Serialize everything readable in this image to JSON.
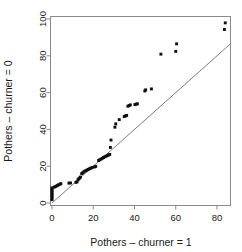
{
  "chart_data": {
    "type": "scatter",
    "title": "",
    "subtitle": "",
    "xlabel": "Pothers – churner = 1",
    "ylabel": "Pothers – churner = 0",
    "xlim": [
      -3,
      87
    ],
    "ylim": [
      -3,
      103
    ],
    "xticks": [
      0,
      20,
      40,
      60,
      80
    ],
    "yticks": [
      0,
      20,
      40,
      60,
      80,
      100
    ],
    "xticklabels": [
      "0",
      "20",
      "40",
      "60",
      "80"
    ],
    "yticklabels": [
      "0",
      "20",
      "40",
      "60",
      "80",
      "100"
    ],
    "grid": false,
    "legend": null,
    "annotations": [],
    "reference_line": {
      "name": "identity-line",
      "type": "line",
      "slope": 1,
      "intercept": 0,
      "x_from": 0,
      "x_to": 87,
      "color": "#6f6f6f"
    },
    "series": [
      {
        "name": "quantile-points",
        "marker": "filled-square",
        "color": "#101010",
        "points": [
          [
            0.0,
            1.8
          ],
          [
            0.0,
            2.6
          ],
          [
            0.0,
            3.4
          ],
          [
            0.0,
            4.2
          ],
          [
            0.0,
            5.0
          ],
          [
            0.0,
            5.8
          ],
          [
            0.0,
            6.6
          ],
          [
            0.0,
            7.4
          ],
          [
            0.0,
            8.2
          ],
          [
            1.0,
            8.6
          ],
          [
            1.6,
            8.9
          ],
          [
            2.1,
            9.2
          ],
          [
            2.7,
            9.6
          ],
          [
            3.2,
            9.9
          ],
          [
            3.8,
            10.2
          ],
          [
            4.3,
            10.5
          ],
          [
            8.2,
            10.8
          ],
          [
            9.0,
            10.9
          ],
          [
            11.6,
            11.2
          ],
          [
            12.1,
            11.5
          ],
          [
            12.6,
            12.6
          ],
          [
            13.0,
            13.2
          ],
          [
            13.4,
            13.6
          ],
          [
            13.8,
            14.1
          ],
          [
            14.4,
            16.0
          ],
          [
            14.9,
            16.4
          ],
          [
            15.4,
            16.9
          ],
          [
            15.9,
            17.3
          ],
          [
            16.5,
            17.6
          ],
          [
            17.1,
            18.0
          ],
          [
            17.7,
            18.3
          ],
          [
            18.3,
            18.7
          ],
          [
            18.9,
            19.0
          ],
          [
            19.5,
            19.3
          ],
          [
            20.6,
            19.6
          ],
          [
            21.2,
            19.9
          ],
          [
            22.6,
            23.1
          ],
          [
            23.2,
            23.5
          ],
          [
            23.8,
            23.9
          ],
          [
            24.4,
            24.3
          ],
          [
            25.0,
            24.7
          ],
          [
            25.6,
            25.1
          ],
          [
            26.2,
            25.4
          ],
          [
            26.8,
            25.8
          ],
          [
            27.4,
            26.1
          ],
          [
            28.0,
            26.4
          ],
          [
            28.3,
            30.2
          ],
          [
            28.6,
            34.2
          ],
          [
            30.5,
            41.2
          ],
          [
            30.9,
            43.0
          ],
          [
            32.6,
            45.3
          ],
          [
            35.0,
            47.0
          ],
          [
            35.6,
            47.3
          ],
          [
            36.2,
            47.6
          ],
          [
            36.8,
            52.6
          ],
          [
            37.4,
            53.0
          ],
          [
            38.0,
            53.3
          ],
          [
            40.2,
            53.5
          ],
          [
            40.8,
            53.7
          ],
          [
            41.4,
            53.9
          ],
          [
            45.0,
            60.9
          ],
          [
            45.4,
            61.5
          ],
          [
            48.2,
            62.0
          ],
          [
            52.8,
            80.9
          ],
          [
            60.0,
            82.4
          ],
          [
            60.4,
            86.5
          ],
          [
            83.6,
            94.3
          ],
          [
            84.0,
            97.9
          ]
        ]
      }
    ]
  },
  "figure": {
    "axis_color": "#8a8a8a",
    "point_color": "#101010",
    "background": "#ffffff"
  }
}
